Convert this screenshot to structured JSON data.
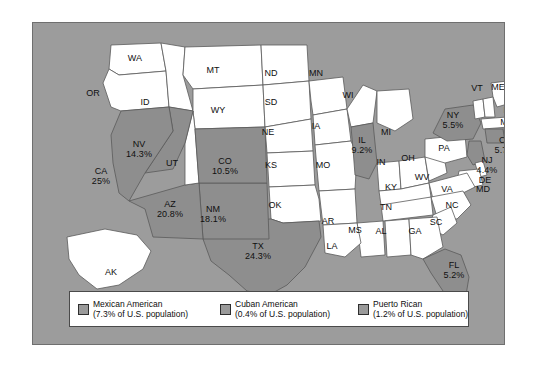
{
  "figure": {
    "background_color": "#9c9c9c",
    "state_fill_unshaded": "#ffffff",
    "state_fill_shaded": "#8e8e8e",
    "border_color": "#6f6f6f"
  },
  "map": {
    "states": [
      {
        "abbr": "WA",
        "pct": "",
        "shaded": false,
        "x": 102,
        "y": 36
      },
      {
        "abbr": "OR",
        "pct": "",
        "shaded": false,
        "x": 60,
        "y": 71
      },
      {
        "abbr": "ID",
        "pct": "",
        "shaded": false,
        "x": 112,
        "y": 80
      },
      {
        "abbr": "MT",
        "pct": "",
        "shaded": false,
        "x": 180,
        "y": 48
      },
      {
        "abbr": "WY",
        "pct": "",
        "shaded": false,
        "x": 185,
        "y": 88
      },
      {
        "abbr": "ND",
        "pct": "",
        "shaded": false,
        "x": 238,
        "y": 51
      },
      {
        "abbr": "SD",
        "pct": "",
        "shaded": false,
        "x": 238,
        "y": 80
      },
      {
        "abbr": "NE",
        "pct": "",
        "shaded": false,
        "x": 235,
        "y": 110
      },
      {
        "abbr": "KS",
        "pct": "",
        "shaded": false,
        "x": 238,
        "y": 143
      },
      {
        "abbr": "MN",
        "pct": "",
        "shaded": false,
        "x": 283,
        "y": 51
      },
      {
        "abbr": "IA",
        "pct": "",
        "shaded": false,
        "x": 283,
        "y": 104
      },
      {
        "abbr": "MO",
        "pct": "",
        "shaded": false,
        "x": 290,
        "y": 143
      },
      {
        "abbr": "WI",
        "pct": "",
        "shaded": false,
        "x": 315,
        "y": 73
      },
      {
        "abbr": "IL",
        "pct": "9.2%",
        "shaded": true,
        "x": 329,
        "y": 122
      },
      {
        "abbr": "MI",
        "pct": "",
        "shaded": false,
        "x": 353,
        "y": 110
      },
      {
        "abbr": "IN",
        "pct": "",
        "shaded": false,
        "x": 348,
        "y": 140
      },
      {
        "abbr": "OH",
        "pct": "",
        "shaded": false,
        "x": 375,
        "y": 136
      },
      {
        "abbr": "KY",
        "pct": "",
        "shaded": false,
        "x": 358,
        "y": 165
      },
      {
        "abbr": "WV",
        "pct": "",
        "shaded": false,
        "x": 389,
        "y": 155
      },
      {
        "abbr": "PA",
        "pct": "",
        "shaded": false,
        "x": 411,
        "y": 126
      },
      {
        "abbr": "NY",
        "pct": "5.5%",
        "shaded": true,
        "x": 420,
        "y": 97
      },
      {
        "abbr": "VT",
        "pct": "",
        "shaded": false,
        "x": 444,
        "y": 66
      },
      {
        "abbr": "ME",
        "pct": "",
        "shaded": false,
        "x": 465,
        "y": 65
      },
      {
        "abbr": "NH",
        "pct": "",
        "shaded": false,
        "x": 477,
        "y": 88
      },
      {
        "abbr": "MA",
        "pct": "",
        "shaded": false,
        "x": 474,
        "y": 100
      },
      {
        "abbr": "RI",
        "pct": "",
        "shaded": false,
        "x": 481,
        "y": 110
      },
      {
        "abbr": "CT",
        "pct": "5.7%",
        "shaded": true,
        "x": 472,
        "y": 122
      },
      {
        "abbr": "NJ",
        "pct": "4.4%",
        "shaded": true,
        "x": 454,
        "y": 142
      },
      {
        "abbr": "DE",
        "pct": "",
        "shaded": false,
        "x": 452,
        "y": 158
      },
      {
        "abbr": "MD",
        "pct": "",
        "shaded": false,
        "x": 450,
        "y": 167
      },
      {
        "abbr": "VA",
        "pct": "",
        "shaded": false,
        "x": 414,
        "y": 167
      },
      {
        "abbr": "NC",
        "pct": "",
        "shaded": false,
        "x": 419,
        "y": 183
      },
      {
        "abbr": "SC",
        "pct": "",
        "shaded": false,
        "x": 403,
        "y": 200
      },
      {
        "abbr": "TN",
        "pct": "",
        "shaded": false,
        "x": 353,
        "y": 185
      },
      {
        "abbr": "AR",
        "pct": "",
        "shaded": false,
        "x": 295,
        "y": 199
      },
      {
        "abbr": "MS",
        "pct": "",
        "shaded": false,
        "x": 322,
        "y": 208
      },
      {
        "abbr": "AL",
        "pct": "",
        "shaded": false,
        "x": 348,
        "y": 209
      },
      {
        "abbr": "GA",
        "pct": "",
        "shaded": false,
        "x": 382,
        "y": 209
      },
      {
        "abbr": "LA",
        "pct": "",
        "shaded": false,
        "x": 299,
        "y": 224
      },
      {
        "abbr": "FL",
        "pct": "5.2%",
        "shaded": true,
        "x": 421,
        "y": 247
      },
      {
        "abbr": "OK",
        "pct": "",
        "shaded": false,
        "x": 242,
        "y": 183
      },
      {
        "abbr": "TX",
        "pct": "24.3%",
        "shaded": true,
        "x": 225,
        "y": 228
      },
      {
        "abbr": "NM",
        "pct": "18.1%",
        "shaded": true,
        "x": 180,
        "y": 191
      },
      {
        "abbr": "AZ",
        "pct": "20.8%",
        "shaded": true,
        "x": 137,
        "y": 186
      },
      {
        "abbr": "UT",
        "pct": "",
        "shaded": false,
        "x": 139,
        "y": 141
      },
      {
        "abbr": "NV",
        "pct": "14.3%",
        "shaded": true,
        "x": 106,
        "y": 126
      },
      {
        "abbr": "CA",
        "pct": "25%",
        "shaded": true,
        "x": 68,
        "y": 153
      },
      {
        "abbr": "CO",
        "pct": "10.5%",
        "shaded": true,
        "x": 192,
        "y": 143
      },
      {
        "abbr": "AK",
        "pct": "",
        "shaded": false,
        "x": 78,
        "y": 250
      },
      {
        "abbr": "HI",
        "pct": "",
        "shaded": false,
        "x": 175,
        "y": 289
      }
    ]
  },
  "legend": {
    "items": [
      {
        "title": "Mexican American",
        "subtitle": "(7.3% of U.S. population)",
        "swatch_color": "#9a9a9a"
      },
      {
        "title": "Cuban American",
        "subtitle": "(0.4% of U.S. population)",
        "swatch_color": "#9a9a9a"
      },
      {
        "title": "Puerto Rican",
        "subtitle": "(1.2% of U.S. population)",
        "swatch_color": "#9a9a9a"
      }
    ]
  }
}
